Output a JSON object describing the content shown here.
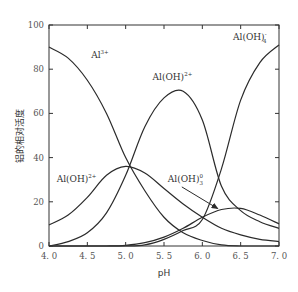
{
  "chart_data": {
    "type": "line",
    "title": "",
    "xlabel": "pH",
    "ylabel": "铝的相对活度",
    "xlim": [
      4.0,
      7.0
    ],
    "ylim": [
      0,
      100
    ],
    "grid": false,
    "legend": "none (inline curve labels)",
    "x_ticks": [
      "4.0",
      "4.5",
      "5.0",
      "5.5",
      "6.0",
      "6.5",
      "7.0"
    ],
    "y_ticks": [
      "0",
      "20",
      "40",
      "60",
      "80",
      "100"
    ],
    "x": [
      4.0,
      4.25,
      4.5,
      4.75,
      5.0,
      5.25,
      5.5,
      5.75,
      6.0,
      6.25,
      6.5,
      6.75,
      7.0
    ],
    "series": [
      {
        "name": "Al3+",
        "label": "Al",
        "sup": "3+",
        "sub": "",
        "values": [
          90,
          85,
          75,
          60,
          40,
          25,
          13,
          6,
          2.5,
          0.5,
          0,
          0,
          0
        ]
      },
      {
        "name": "Al(OH)2+",
        "label": "Al(OH)",
        "sup": "2+",
        "sub": "",
        "values": [
          9.5,
          14,
          22,
          32,
          36,
          33,
          26,
          19,
          13,
          8,
          5,
          3,
          2
        ]
      },
      {
        "name": "Al(OH)2 +",
        "label": "Al(OH)",
        "sup": "2+",
        "sub": "",
        "values": [
          0,
          2,
          6,
          15,
          32,
          54,
          67,
          70,
          57,
          27,
          16,
          11,
          8
        ]
      },
      {
        "name": "Al(OH)3 0",
        "label": "Al(OH)",
        "sup": "0",
        "sub": "3",
        "values": [
          0,
          0,
          0,
          0,
          0.3,
          1.5,
          4,
          8,
          13,
          16.5,
          17,
          14,
          10
        ]
      },
      {
        "name": "Al(OH)4 -",
        "label": "Al(OH)",
        "sup": "-",
        "sub": "4",
        "values": [
          0,
          0,
          0,
          0,
          0,
          0.5,
          3,
          7,
          12,
          35,
          66,
          83,
          91
        ]
      }
    ],
    "annotations": [
      {
        "text": "Al",
        "sup": "3+",
        "sub": "",
        "near_x": 4.55,
        "near_y": 85
      },
      {
        "text": "Al(OH)",
        "sup": "2+",
        "sub": "",
        "near_x": 4.1,
        "near_y": 29,
        "target": "Al(OH)2+"
      },
      {
        "text": "Al(OH)",
        "sup": "2+",
        "sub": "",
        "near_x": 5.35,
        "near_y": 75,
        "target": "Al(OH)2 +"
      },
      {
        "text": "Al(OH)",
        "sup": "-",
        "sub": "4",
        "near_x": 6.4,
        "near_y": 93,
        "target": "Al(OH)4 -"
      },
      {
        "text": "Al(OH)",
        "sup": "0",
        "sub": "3",
        "near_x": 5.55,
        "near_y": 29,
        "target": "Al(OH)3 0",
        "arrow_to": [
          6.2,
          16.5
        ]
      }
    ]
  }
}
